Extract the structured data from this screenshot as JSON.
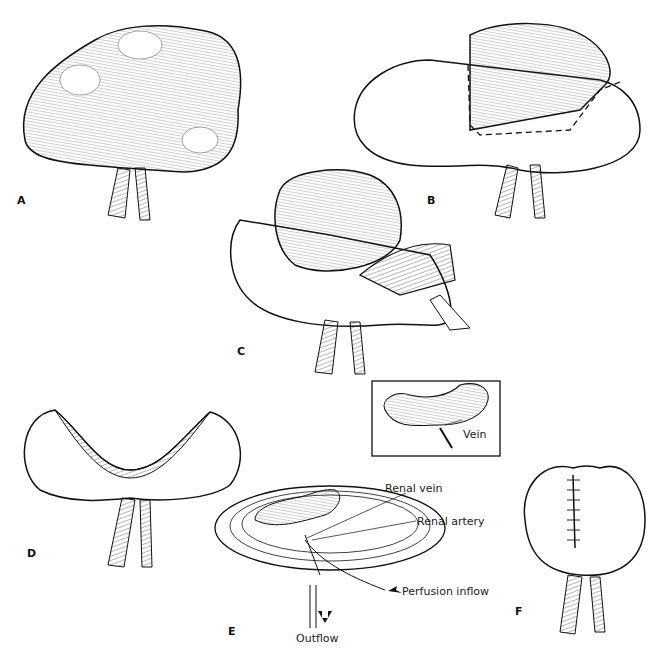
{
  "figure": {
    "panels": [
      {
        "id": "A",
        "label": "A",
        "description": "Large lobulated renal tumor with renal vessels"
      },
      {
        "id": "B",
        "label": "B",
        "description": "Tumor with dashed excision line on kidney"
      },
      {
        "id": "C",
        "label": "C",
        "description": "Tumor being resected, kidney opened"
      },
      {
        "id": "D",
        "label": "D",
        "description": "Kidney after tumor removal, open cavity"
      },
      {
        "id": "E",
        "label": "E",
        "description": "Kidney on perfusion dish (bench surgery)"
      },
      {
        "id": "F",
        "label": "F",
        "description": "Reconstructed kidney with sutured closure"
      }
    ],
    "inset": {
      "label": "Vein"
    },
    "annotations": {
      "renal_vein": "Renal vein",
      "renal_artery": "Renal artery",
      "perfusion_inflow": "Perfusion inflow",
      "outflow": "Outflow"
    }
  }
}
